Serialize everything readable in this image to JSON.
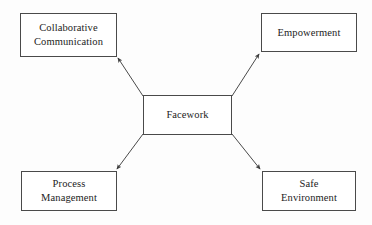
{
  "diagram": {
    "type": "hub-and-spoke concept map",
    "center": {
      "id": "facework",
      "label": "Facework",
      "x": 143,
      "y": 95,
      "w": 89,
      "h": 40
    },
    "nodes": [
      {
        "id": "collaborative-communication",
        "label": "Collaborative\nCommunication",
        "x": 20,
        "y": 13,
        "w": 97,
        "h": 44
      },
      {
        "id": "empowerment",
        "label": "Empowerment",
        "x": 261,
        "y": 13,
        "w": 96,
        "h": 39
      },
      {
        "id": "process-management",
        "label": "Process\nManagement",
        "x": 21,
        "y": 171,
        "w": 96,
        "h": 40
      },
      {
        "id": "safe-environment",
        "label": "Safe\nEnvironment",
        "x": 262,
        "y": 171,
        "w": 94,
        "h": 40
      }
    ],
    "edges": [
      {
        "id": "facework-to-collaborative-communication",
        "from": "facework",
        "to": "collaborative-communication",
        "x1": 143,
        "y1": 96,
        "x2": 118,
        "y2": 58
      },
      {
        "id": "facework-to-empowerment",
        "from": "facework",
        "to": "empowerment",
        "x1": 232,
        "y1": 96,
        "x2": 259,
        "y2": 54
      },
      {
        "id": "facework-to-process-management",
        "from": "facework",
        "to": "process-management",
        "x1": 143,
        "y1": 134,
        "x2": 116,
        "y2": 170
      },
      {
        "id": "facework-to-safe-environment",
        "from": "facework",
        "to": "safe-environment",
        "x1": 232,
        "y1": 134,
        "x2": 261,
        "y2": 170
      }
    ],
    "style": {
      "line_color": "#4a4a4a",
      "box_border_color": "#4a4a4a",
      "text_color": "#1c1c1c",
      "background_color": "#fdfdfd",
      "arrowhead": "filled-triangle"
    }
  }
}
